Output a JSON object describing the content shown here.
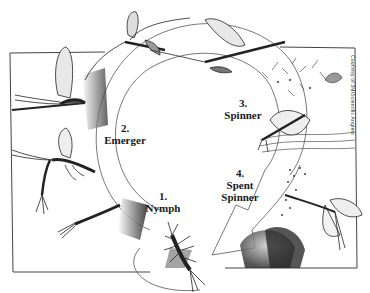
{
  "diagram": {
    "stages": [
      {
        "number": "1.",
        "name": "Nymph"
      },
      {
        "number": "2.",
        "name": "Emerger"
      },
      {
        "number": "3.",
        "name": "Spinner"
      },
      {
        "number": "4.",
        "name": "Spent",
        "name2": "Spinner"
      }
    ],
    "credit": "Courtesy of 3M/Scientific Anglers",
    "colors": {
      "ink": "#1a1a1a",
      "paper": "#ffffff",
      "shade": "#555555"
    }
  }
}
